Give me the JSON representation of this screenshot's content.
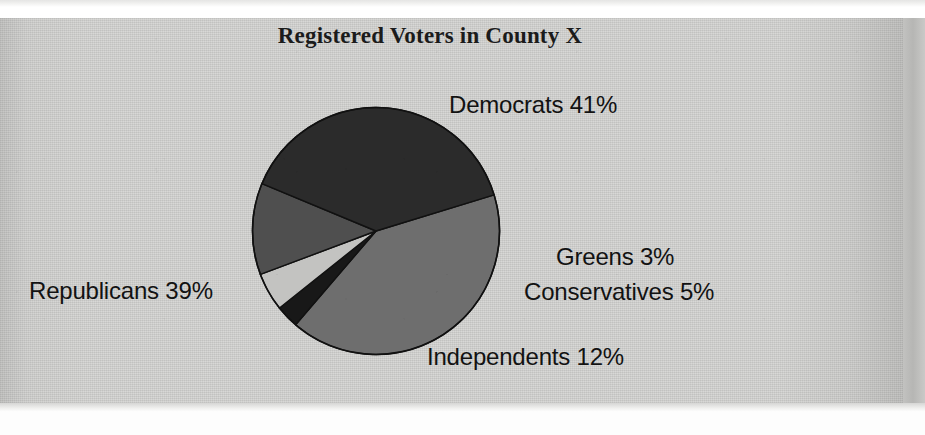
{
  "figure": {
    "title": "Registered Voters in County X",
    "background_color": "#d5d5d3",
    "page_color": "#ffffff"
  },
  "chart_data": {
    "type": "pie",
    "title": "Registered Voters in County X",
    "xlabel": "",
    "ylabel": "",
    "unit": "%",
    "total": 100,
    "legend": "none (direct slice labels)",
    "label_format": "{name} {value}%",
    "start_angle_deg": -17,
    "direction": "clockwise",
    "categories": [
      "Democrats",
      "Greens",
      "Conservatives",
      "Independents",
      "Republicans"
    ],
    "values": [
      41,
      3,
      5,
      12,
      39
    ],
    "colors": [
      "#6e6e6e",
      "#181818",
      "#c3c3c1",
      "#4f4f4f",
      "#2b2b2b"
    ],
    "slices": [
      {
        "name": "Democrats",
        "value": 41,
        "label": "Democrats 41%",
        "color": "#6e6e6e"
      },
      {
        "name": "Greens",
        "value": 3,
        "label": "Greens 3%",
        "color": "#181818"
      },
      {
        "name": "Conservatives",
        "value": 5,
        "label": "Conservatives 5%",
        "color": "#c3c3c1"
      },
      {
        "name": "Independents",
        "value": 12,
        "label": "Independents 12%",
        "color": "#4f4f4f"
      },
      {
        "name": "Republicans",
        "value": 39,
        "label": "Republicans 39%",
        "color": "#2b2b2b"
      }
    ]
  },
  "labels": {
    "democrats": "Democrats 41%",
    "greens": "Greens 3%",
    "conservatives": "Conservatives 5%",
    "independents": "Independents 12%",
    "republicans": "Republicans 39%"
  }
}
